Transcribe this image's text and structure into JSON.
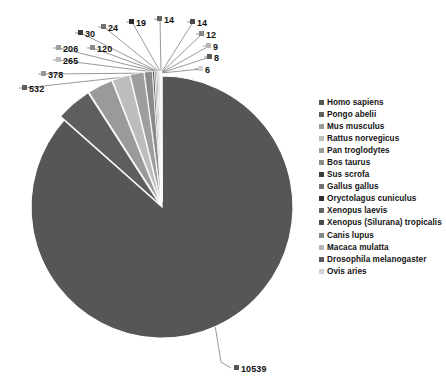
{
  "chart_data": {
    "type": "pie",
    "title": "",
    "subtitle": "",
    "xlabel": "",
    "ylabel": "",
    "legend_position": "right",
    "grid": false,
    "total": 12186,
    "categories": [
      "Homo sapiens",
      "Pongo abelii",
      "Mus musculus",
      "Rattus norvegicus",
      "Pan troglodytes",
      "Bos taurus",
      "Sus scrofa",
      "Gallus gallus",
      "Oryctolagus cuniculus",
      "Xenopus laevis",
      "Xenopus (Silurana) tropicalis",
      "Canis lupus",
      "Macaca mulatta",
      "Drosophila melanogaster",
      "Ovis aries"
    ],
    "values": [
      10539,
      532,
      378,
      265,
      206,
      120,
      30,
      24,
      19,
      14,
      14,
      12,
      9,
      8,
      6
    ],
    "colors": [
      "#565656",
      "#5e5e5e",
      "#9a9a9a",
      "#bdbdbd",
      "#9e9e9e",
      "#8a8a8a",
      "#3a3a3a",
      "#707070",
      "#2e2e2e",
      "#646464",
      "#4a4a4a",
      "#878787",
      "#b5b5b5",
      "#5a5a5a",
      "#d2d2d2"
    ],
    "slice_labels": [
      {
        "value": "10539",
        "x": 234,
        "y": 363,
        "color": "#565656",
        "anchor": "left"
      },
      {
        "value": "532",
        "x": 22,
        "y": 83,
        "color": "#5e5e5e",
        "anchor": "left"
      },
      {
        "value": "378",
        "x": 41,
        "y": 69,
        "color": "#9a9a9a",
        "anchor": "left"
      },
      {
        "value": "265",
        "x": 56,
        "y": 55,
        "color": "#bdbdbd",
        "anchor": "left"
      },
      {
        "value": "206",
        "x": 56,
        "y": 43,
        "color": "#9e9e9e",
        "anchor": "left"
      },
      {
        "value": "120",
        "x": 90,
        "y": 43,
        "color": "#8a8a8a",
        "anchor": "left"
      },
      {
        "value": "30",
        "x": 78,
        "y": 28,
        "color": "#3a3a3a",
        "anchor": "left"
      },
      {
        "value": "24",
        "x": 101,
        "y": 22,
        "color": "#707070",
        "anchor": "left"
      },
      {
        "value": "19",
        "x": 129,
        "y": 17,
        "color": "#2e2e2e",
        "anchor": "left"
      },
      {
        "value": "14",
        "x": 157,
        "y": 14,
        "color": "#646464",
        "anchor": "left"
      },
      {
        "value": "14",
        "x": 190,
        "y": 17,
        "color": "#4a4a4a",
        "anchor": "left"
      },
      {
        "value": "12",
        "x": 199,
        "y": 29,
        "color": "#878787",
        "anchor": "left"
      },
      {
        "value": "9",
        "x": 206,
        "y": 41,
        "color": "#b5b5b5",
        "anchor": "left"
      },
      {
        "value": "8",
        "x": 207,
        "y": 52,
        "color": "#5a5a5a",
        "anchor": "left"
      },
      {
        "value": "6",
        "x": 198,
        "y": 64,
        "color": "#d2d2d2",
        "anchor": "left"
      }
    ],
    "geometry": {
      "center_x": 162,
      "center_y": 207,
      "radius": 131,
      "explode_gap": 5,
      "converge_x": 161,
      "converge_y": 73
    }
  },
  "legend": {
    "items": [
      {
        "label": "Homo sapiens",
        "color": "#565656"
      },
      {
        "label": "Pongo abelii",
        "color": "#5e5e5e"
      },
      {
        "label": "Mus musculus",
        "color": "#9a9a9a"
      },
      {
        "label": "Rattus norvegicus",
        "color": "#bdbdbd"
      },
      {
        "label": "Pan troglodytes",
        "color": "#9e9e9e"
      },
      {
        "label": "Bos taurus",
        "color": "#8a8a8a"
      },
      {
        "label": "Sus scrofa",
        "color": "#3a3a3a"
      },
      {
        "label": "Gallus gallus",
        "color": "#707070"
      },
      {
        "label": "Oryctolagus cuniculus",
        "color": "#2e2e2e"
      },
      {
        "label": "Xenopus laevis",
        "color": "#646464"
      },
      {
        "label": "Xenopus (Silurana) tropicalis",
        "color": "#4a4a4a"
      },
      {
        "label": "Canis lupus",
        "color": "#878787"
      },
      {
        "label": "Macaca mulatta",
        "color": "#b5b5b5"
      },
      {
        "label": "Drosophila melanogaster",
        "color": "#5a5a5a"
      },
      {
        "label": "Ovis aries",
        "color": "#d2d2d2"
      }
    ]
  }
}
